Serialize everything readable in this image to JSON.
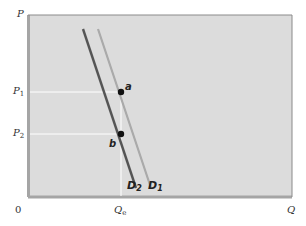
{
  "diagram": {
    "type": "supply-demand-shift",
    "axes": {
      "y_label": "P",
      "x_label": "Q",
      "origin_label": "0"
    },
    "price_levels": [
      {
        "label": "P",
        "sub": "1"
      },
      {
        "label": "P",
        "sub": "2"
      }
    ],
    "quantity_levels": [
      {
        "label": "Q",
        "sub": "e"
      }
    ],
    "points": [
      {
        "label": "a"
      },
      {
        "label": "b"
      }
    ],
    "curves": [
      {
        "label": "D",
        "sub": "2",
        "color": "#555555"
      },
      {
        "label": "D",
        "sub": "1",
        "color": "#aaaaaa"
      }
    ],
    "colors": {
      "plot_background": "#dcdcdc",
      "frame": "#9a9a9a",
      "guide_lines": "#ffffff",
      "point": "#111111"
    }
  }
}
